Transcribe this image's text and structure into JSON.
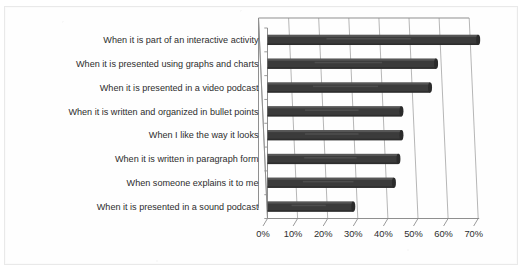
{
  "chart_data": {
    "type": "bar",
    "orientation": "horizontal",
    "style": "3d-bar-scanned",
    "title": "",
    "subtitle": "",
    "xlabel": "",
    "ylabel": "",
    "xlim": [
      0,
      70
    ],
    "xtick_step": 10,
    "grid": true,
    "legend": false,
    "legend_position": "none",
    "bar_color": "#3b3b3b",
    "categories": [
      "When it is part of an interactive activity",
      "When it is presented using graphs and charts",
      "When it is presented in a video podcast",
      "When it is written and organized in bullet points",
      "When I like the way it looks",
      "When it is written in paragraph form",
      "When someone explains it to me",
      "When it is presented in a sound podcast"
    ],
    "values": [
      70,
      56,
      54,
      44.5,
      44.5,
      43.5,
      42,
      28.5
    ],
    "value_labels": [
      "70%",
      "56%",
      "54%",
      "45%",
      "45%",
      "44%",
      "42%",
      "29%"
    ],
    "xticks": [
      0,
      10,
      20,
      30,
      40,
      50,
      60,
      70
    ],
    "xticklabels": [
      "0%",
      "10%",
      "20%",
      "30%",
      "40%",
      "50%",
      "60%",
      "70%"
    ]
  },
  "colors": {
    "bar": "#3b3b3b",
    "bar_highlight": "#6e6e6e",
    "grid": "#a9a9a9",
    "axis": "#8f8f8f",
    "text": "#2d2d2d",
    "background": "#fefefe",
    "frame": "#e9e9e9"
  }
}
